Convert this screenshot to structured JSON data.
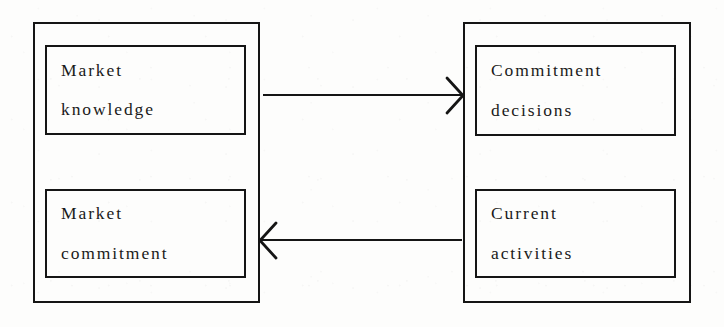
{
  "diagram": {
    "type": "flow-diagram",
    "background_color": "#fdfdfc",
    "stroke_color": "#151515",
    "groups": [
      {
        "id": "state-aspects",
        "name": "left-group",
        "nodes": [
          {
            "id": "market-knowledge",
            "line1": "Market",
            "line2": "knowledge"
          },
          {
            "id": "market-commitment",
            "line1": "Market",
            "line2": "commitment"
          }
        ]
      },
      {
        "id": "change-aspects",
        "name": "right-group",
        "nodes": [
          {
            "id": "commitment-decisions",
            "line1": "Commitment",
            "line2": "decisions"
          },
          {
            "id": "current-activities",
            "line1": "Current",
            "line2": "activities"
          }
        ]
      }
    ],
    "arrows": [
      {
        "id": "knowledge-to-decisions",
        "from": "market-knowledge",
        "to": "commitment-decisions",
        "direction": "right",
        "head_style": "open-chevron"
      },
      {
        "id": "activities-to-commitment",
        "from": "current-activities",
        "to": "market-commitment",
        "direction": "left",
        "head_style": "open-chevron"
      }
    ]
  }
}
